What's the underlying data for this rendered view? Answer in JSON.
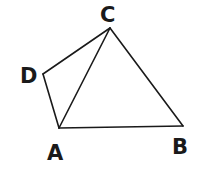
{
  "diagram": {
    "type": "quadrilateral-with-diagonal",
    "vertices": [
      {
        "name": "A",
        "x": 59,
        "y": 128,
        "label_x": 47,
        "label_y": 160
      },
      {
        "name": "B",
        "x": 183,
        "y": 126,
        "label_x": 172,
        "label_y": 154
      },
      {
        "name": "C",
        "x": 110,
        "y": 28,
        "label_x": 100,
        "label_y": 22
      },
      {
        "name": "D",
        "x": 43,
        "y": 74,
        "label_x": 20,
        "label_y": 83
      }
    ],
    "edges": [
      {
        "from": "A",
        "to": "B"
      },
      {
        "from": "B",
        "to": "C"
      },
      {
        "from": "C",
        "to": "D"
      },
      {
        "from": "D",
        "to": "A"
      },
      {
        "from": "A",
        "to": "C"
      }
    ],
    "stroke_color": "#1a1a1a",
    "background": "#ffffff"
  }
}
